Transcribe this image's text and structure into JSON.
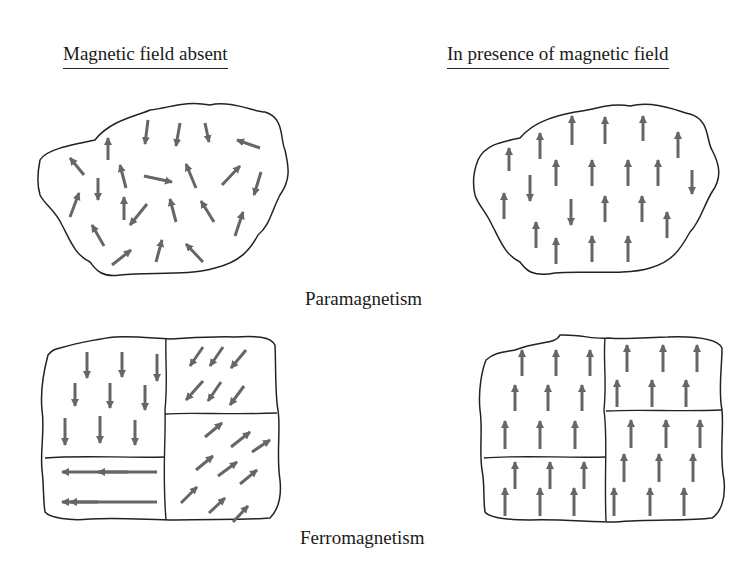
{
  "headings": {
    "left": "Magnetic field absent",
    "right": "In presence of magnetic field"
  },
  "captions": {
    "para": "Paramagnetism",
    "ferro": "Ferromagnetism"
  },
  "colors": {
    "arrow": "#666666",
    "outline": "#222222",
    "background": "#ffffff"
  },
  "panels": [
    {
      "id": "para-absent",
      "outline": "M40,160 C45,150 70,145 95,140 C110,120 140,115 150,110 C170,108 185,100 210,105 C230,100 255,112 265,112 C285,118 280,140 285,150 C288,165 292,178 280,195 C272,210 270,225 258,235 C250,250 240,262 215,268 C190,276 150,272 120,275 C100,278 95,268 90,262 C75,255 70,240 62,225 C55,210 45,205 40,195 C37,185 38,170 40,160 Z",
      "dividers": [],
      "arrows": [
        [
          148,
          120,
          145,
          144
        ],
        [
          180,
          123,
          176,
          146
        ],
        [
          205,
          123,
          209,
          142
        ],
        [
          260,
          148,
          237,
          140
        ],
        [
          108,
          160,
          108,
          138
        ],
        [
          84,
          175,
          70,
          158
        ],
        [
          98,
          178,
          98,
          200
        ],
        [
          126,
          188,
          120,
          165
        ],
        [
          144,
          176,
          172,
          182
        ],
        [
          196,
          188,
          186,
          164
        ],
        [
          222,
          185,
          240,
          166
        ],
        [
          261,
          172,
          254,
          195
        ],
        [
          70,
          217,
          79,
          193
        ],
        [
          124,
          220,
          124,
          197
        ],
        [
          147,
          204,
          130,
          225
        ],
        [
          176,
          222,
          170,
          199
        ],
        [
          214,
          222,
          201,
          201
        ],
        [
          235,
          236,
          243,
          212
        ],
        [
          104,
          246,
          92,
          225
        ],
        [
          112,
          265,
          131,
          250
        ],
        [
          156,
          262,
          162,
          240
        ],
        [
          203,
          262,
          186,
          244
        ]
      ]
    },
    {
      "id": "para-present",
      "outline": "M478,160 C485,145 500,142 520,138 C535,120 560,115 575,112 C595,110 610,102 630,106 C655,100 680,112 690,114 C710,120 706,140 712,150 C720,165 722,178 712,192 C704,205 700,222 690,232 C680,250 672,262 650,268 C625,276 580,270 555,273 C530,278 525,268 520,262 C505,255 500,240 492,225 C485,210 478,205 475,195 C472,182 474,170 478,160 Z",
      "dividers": [],
      "arrows": [
        [
          509,
          171,
          509,
          148
        ],
        [
          540,
          159,
          540,
          133
        ],
        [
          572,
          145,
          572,
          116
        ],
        [
          605,
          144,
          605,
          117
        ],
        [
          643,
          141,
          643,
          116
        ],
        [
          678,
          158,
          678,
          132
        ],
        [
          556,
          186,
          556,
          160
        ],
        [
          592,
          186,
          592,
          160
        ],
        [
          628,
          186,
          628,
          160
        ],
        [
          658,
          186,
          658,
          160
        ],
        [
          692,
          170,
          692,
          194
        ],
        [
          530,
          175,
          530,
          201
        ],
        [
          504,
          219,
          504,
          193
        ],
        [
          571,
          199,
          571,
          225
        ],
        [
          605,
          222,
          605,
          196
        ],
        [
          642,
          222,
          642,
          196
        ],
        [
          667,
          238,
          667,
          212
        ],
        [
          536,
          248,
          536,
          222
        ],
        [
          556,
          264,
          556,
          238
        ],
        [
          592,
          262,
          592,
          236
        ],
        [
          628,
          262,
          628,
          236
        ]
      ]
    },
    {
      "id": "ferro-absent",
      "outline": "M60,348 C80,342 105,338 115,337 C135,336 150,338 170,339 C190,338 215,336 235,337 C255,336 270,336 275,345 C276,365 275,395 278,410 C281,430 276,455 280,480 C282,500 276,512 270,518 C245,520 210,519 175,520 C150,520 120,517 90,519 C70,521 50,518 45,512 C43,500 44,485 42,470 C40,450 45,430 42,410 C40,390 44,370 48,355 C52,350 55,349 60,348 Z",
      "dividers": [
        "M166,338 C165,360 168,380 165,410 C166,440 162,470 166,520",
        "M165,414 C190,412 230,415 277,413",
        "M45,458 C80,455 120,458 165,457"
      ],
      "arrows": [
        [
          87,
          352,
          87,
          378
        ],
        [
          122,
          352,
          122,
          377
        ],
        [
          157,
          354,
          157,
          381
        ],
        [
          75,
          383,
          75,
          406
        ],
        [
          110,
          383,
          110,
          408
        ],
        [
          145,
          385,
          145,
          410
        ],
        [
          65,
          418,
          65,
          445
        ],
        [
          100,
          416,
          100,
          443
        ],
        [
          135,
          420,
          135,
          445
        ],
        [
          203,
          347,
          190,
          366
        ],
        [
          223,
          347,
          210,
          366
        ],
        [
          246,
          350,
          231,
          368
        ],
        [
          203,
          381,
          186,
          400
        ],
        [
          221,
          382,
          208,
          401
        ],
        [
          244,
          386,
          230,
          405
        ],
        [
          205,
          437,
          222,
          423
        ],
        [
          231,
          447,
          250,
          432
        ],
        [
          252,
          452,
          270,
          440
        ],
        [
          196,
          470,
          213,
          456
        ],
        [
          218,
          476,
          237,
          462
        ],
        [
          240,
          484,
          257,
          470
        ],
        [
          181,
          503,
          197,
          487
        ],
        [
          209,
          513,
          225,
          498
        ],
        [
          233,
          522,
          248,
          506
        ],
        [
          157,
          472,
          62,
          472
        ],
        [
          157,
          502,
          62,
          502
        ],
        [
          128,
          472,
          98,
          472
        ],
        [
          98,
          502,
          70,
          502
        ]
      ]
    },
    {
      "id": "ferro-present",
      "outline": "M515,350 C540,340 555,345 560,335 C580,334 595,340 608,338 C630,340 650,337 668,337 C700,336 718,340 722,348 C722,368 718,390 722,410 C724,430 719,455 724,480 C726,500 720,513 712,518 C690,521 650,519 615,522 C590,522 560,519 530,520 C505,520 490,518 485,512 C483,498 485,485 482,470 C479,450 483,430 480,410 C478,390 482,370 486,360 C495,352 505,352 515,350 Z",
      "dividers": [
        "M605,338 C603,360 607,380 604,410 C608,440 604,470 606,521",
        "M606,411 C640,409 680,412 722,410",
        "M484,458 C520,455 560,458 606,457"
      ],
      "arrows": [
        [
          522,
          376,
          522,
          350
        ],
        [
          556,
          376,
          556,
          350
        ],
        [
          590,
          376,
          590,
          350
        ],
        [
          515,
          411,
          515,
          385
        ],
        [
          548,
          411,
          548,
          385
        ],
        [
          582,
          411,
          582,
          385
        ],
        [
          505,
          449,
          505,
          421
        ],
        [
          540,
          449,
          540,
          421
        ],
        [
          575,
          449,
          575,
          421
        ],
        [
          627,
          372,
          627,
          345
        ],
        [
          663,
          372,
          663,
          345
        ],
        [
          697,
          372,
          697,
          345
        ],
        [
          617,
          407,
          617,
          380
        ],
        [
          652,
          407,
          652,
          380
        ],
        [
          686,
          407,
          686,
          380
        ],
        [
          631,
          448,
          631,
          420
        ],
        [
          666,
          448,
          666,
          420
        ],
        [
          700,
          448,
          700,
          420
        ],
        [
          624,
          482,
          624,
          454
        ],
        [
          659,
          482,
          659,
          454
        ],
        [
          693,
          482,
          693,
          454
        ],
        [
          614,
          516,
          614,
          488
        ],
        [
          650,
          516,
          650,
          488
        ],
        [
          684,
          516,
          684,
          488
        ],
        [
          515,
          489,
          515,
          462
        ],
        [
          550,
          489,
          550,
          462
        ],
        [
          584,
          489,
          584,
          462
        ],
        [
          505,
          516,
          505,
          488
        ],
        [
          540,
          516,
          540,
          488
        ],
        [
          574,
          516,
          574,
          488
        ]
      ]
    }
  ]
}
